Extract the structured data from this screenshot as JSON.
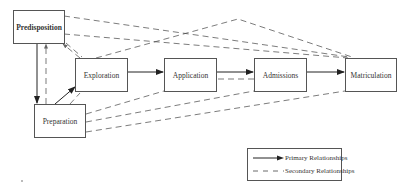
{
  "diagram": {
    "nodes": {
      "predisposition": {
        "label": "Predisposition"
      },
      "exploration": {
        "label": "Exploration"
      },
      "application": {
        "label": "Application"
      },
      "admissions": {
        "label": "Admissions"
      },
      "matriculation": {
        "label": "Matriculation"
      },
      "preparation": {
        "label": "Preparation"
      }
    },
    "primary_edges": [
      {
        "from": "Predisposition",
        "to": "Preparation"
      },
      {
        "from": "Preparation",
        "to": "Exploration"
      },
      {
        "from": "Exploration",
        "to": "Application"
      },
      {
        "from": "Application",
        "to": "Admissions"
      },
      {
        "from": "Admissions",
        "to": "Matriculation"
      }
    ],
    "secondary_edges": [
      {
        "from": "Predisposition",
        "to": "Matriculation"
      },
      {
        "from": "Predisposition",
        "to": "Matriculation"
      },
      {
        "from": "Exploration",
        "to": "Matriculation"
      },
      {
        "from": "Exploration",
        "to": "Predisposition"
      },
      {
        "from": "Preparation",
        "to": "Predisposition"
      },
      {
        "from": "Preparation",
        "to": "Exploration"
      },
      {
        "from": "Preparation",
        "to": "Application"
      },
      {
        "from": "Preparation",
        "to": "Admissions"
      },
      {
        "from": "Preparation",
        "to": "Matriculation"
      },
      {
        "from": "Admissions",
        "to": "Application"
      }
    ],
    "legend": {
      "primary_label": "Primary Relationships",
      "secondary_label": "Secondary Relationships"
    },
    "colors": {
      "line": "#333333",
      "border": "#555555",
      "text": "#333333"
    }
  }
}
